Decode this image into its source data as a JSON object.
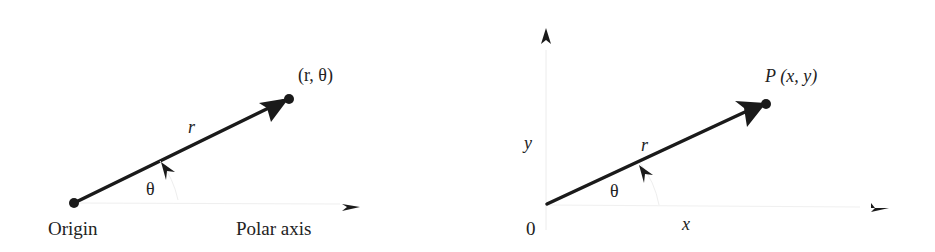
{
  "left_panel": {
    "title": "Polar coordinate system",
    "origin_label": "Origin",
    "polar_axis_label": "Polar axis",
    "point_label": "(r, θ)",
    "radius_label": "r",
    "angle_label": "θ"
  },
  "right_panel": {
    "title": "Polar to Cartesian relation",
    "origin_label": "0",
    "point_label": "P  (x, y)",
    "radius_label": "r",
    "angle_label": "θ",
    "x_label": "x",
    "y_label": "y"
  },
  "colors": {
    "ink": "#1a1a1a",
    "faint_axis": "#e6e6e6",
    "background": "#ffffff"
  }
}
